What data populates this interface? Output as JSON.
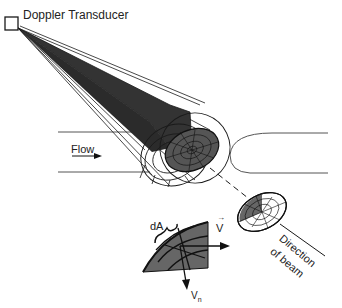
{
  "diagram": {
    "labels": {
      "transducer": "Doppler Transducer",
      "flow": "Flow",
      "dA": "dA",
      "V": "V",
      "V_vector_mark": "→",
      "Vn": "V",
      "Vn_sub": "n",
      "direction_line1": "Direction",
      "direction_line2": "of beam"
    },
    "colors": {
      "line": "#1a1a1a",
      "beam_fill": "#333333",
      "sample_fill": "#5a5a5a",
      "vessel": "#555555",
      "background": "#ffffff"
    }
  }
}
